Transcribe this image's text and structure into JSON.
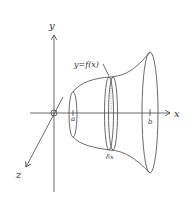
{
  "diagram": {
    "axes": {
      "x_label": "x",
      "y_label": "y",
      "z_label": "z",
      "origin_label": "O"
    },
    "curve_label": "y=f(x)",
    "bounds": {
      "lower": "a",
      "upper": "b"
    },
    "slice_label": "δx",
    "colors": {
      "line": "#444444",
      "text": "#333333",
      "background": "#ffffff"
    }
  }
}
